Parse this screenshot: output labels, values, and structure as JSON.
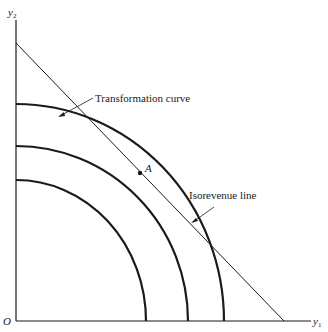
{
  "diagram": {
    "type": "production-possibility",
    "axes": {
      "x_label": "y",
      "x_sub": "1",
      "y_label": "y",
      "y_sub": "2",
      "origin_label": "O"
    },
    "annotations": {
      "transformation_curve": "Transformation curve",
      "isorevenue_line": "Isorevenue line",
      "point_a": "A"
    },
    "curves": [
      {
        "name": "outer-transformation-curve",
        "y_intercept_px": 104,
        "x_intercept_px": 224
      },
      {
        "name": "middle-transformation-curve",
        "y_intercept_px": 146,
        "x_intercept_px": 188
      },
      {
        "name": "inner-transformation-curve",
        "y_intercept_px": 180,
        "x_intercept_px": 146
      }
    ],
    "isorevenue": {
      "from": [
        16,
        43
      ],
      "to": [
        284,
        321
      ]
    },
    "tangent_point": [
      140,
      173
    ],
    "colors": {
      "ink": "#1a1a1a",
      "background": "#ffffff"
    }
  }
}
